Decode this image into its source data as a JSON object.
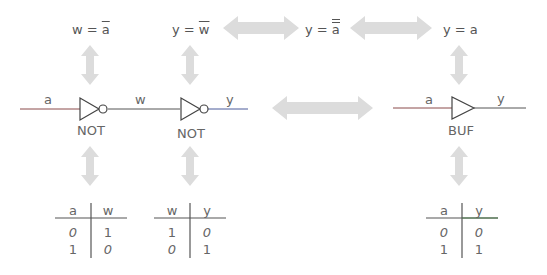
{
  "equations": {
    "not1": {
      "lhs": "w = ",
      "bar": "a"
    },
    "not2": {
      "lhs": "y = ",
      "bar": "w"
    },
    "double": {
      "lhs": "y = ",
      "bar": "a"
    },
    "buf": {
      "text": "y = a"
    }
  },
  "circuits": {
    "not_chain": {
      "input_label": "a",
      "middle_label": "w",
      "output_label": "y",
      "gate1_label": "NOT",
      "gate2_label": "NOT"
    },
    "buffer": {
      "input_label": "a",
      "output_label": "y",
      "gate_label": "BUF"
    }
  },
  "truth_tables": [
    {
      "headers": [
        "a",
        "w"
      ],
      "rows": [
        [
          "0",
          "1"
        ],
        [
          "1",
          "0"
        ]
      ]
    },
    {
      "headers": [
        "w",
        "y"
      ],
      "rows": [
        [
          "1",
          "0"
        ],
        [
          "0",
          "1"
        ]
      ]
    },
    {
      "headers": [
        "a",
        "y"
      ],
      "rows": [
        [
          "0",
          "0"
        ],
        [
          "1",
          "1"
        ]
      ]
    }
  ],
  "colors": {
    "arrow": "#dcdcdc",
    "wire": "#555555",
    "wire_a": "#8a4a4a",
    "wire_y": "#4a5a9a",
    "wire_y_buf": "#4a7a4a"
  }
}
